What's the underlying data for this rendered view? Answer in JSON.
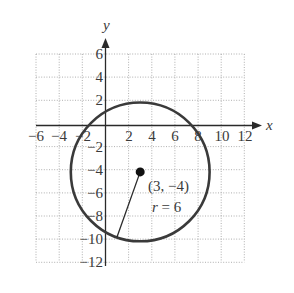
{
  "diagram": {
    "type": "coordinate-plane-circle",
    "axes": {
      "x_label": "x",
      "y_label": "y",
      "x_ticks": [
        "−6",
        "−4",
        "−2",
        "2",
        "4",
        "6",
        "8",
        "10",
        "12"
      ],
      "y_ticks": [
        "6",
        "4",
        "2",
        "−2",
        "−4",
        "−6",
        "−8",
        "−10",
        "−12"
      ],
      "x_range": [
        -6,
        12
      ],
      "y_range": [
        -12,
        6
      ],
      "grid_step": 2,
      "grid": true
    },
    "circle": {
      "center": [
        3,
        -4
      ],
      "radius": 6,
      "center_label": "(3, −4)",
      "radius_label_var": "r",
      "radius_label_eq": " = 6"
    },
    "colors": {
      "circle": "#3a3a3a",
      "axes": "#2a2a2a",
      "grid": "#9a9a9a",
      "text": "#3a3a3a"
    }
  }
}
